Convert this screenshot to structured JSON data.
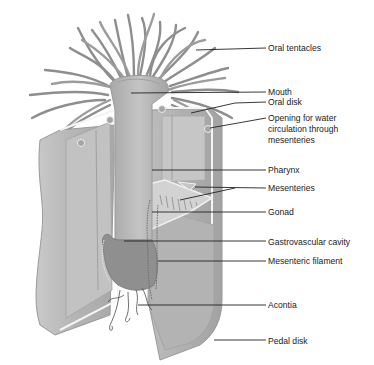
{
  "diagram": {
    "colors": {
      "body": "#b9b9b9",
      "body_dark": "#9a9a9a",
      "body_light": "#d6d6d6",
      "tentacle": "#8e8e8e",
      "gonad": "#8a8a8a",
      "leader_line": "#222222",
      "text": "#1a1a1a"
    },
    "labels": [
      {
        "id": "oral-tentacles",
        "text": "Oral tentacles",
        "x": 268,
        "y": 43,
        "line": [
          [
            196,
            50
          ],
          [
            266,
            48
          ]
        ]
      },
      {
        "id": "mouth",
        "text": "Mouth",
        "x": 268,
        "y": 87,
        "line": [
          [
            131,
            93
          ],
          [
            266,
            92
          ]
        ]
      },
      {
        "id": "oral-disk",
        "text": "Oral disk",
        "x": 268,
        "y": 97,
        "line": [
          [
            191,
            113
          ],
          [
            235,
            103
          ],
          [
            266,
            102
          ]
        ]
      },
      {
        "id": "opening-water",
        "text_lines": [
          "Opening for water",
          "circulation through",
          "mesenteries"
        ],
        "x": 268,
        "y": 113,
        "line": [
          [
            210,
            128
          ],
          [
            266,
            118
          ]
        ]
      },
      {
        "id": "pharynx",
        "text": "Pharynx",
        "x": 268,
        "y": 165,
        "line": [
          [
            152,
            170
          ],
          [
            266,
            170
          ]
        ]
      },
      {
        "id": "mesenteries",
        "text": "Mesenteries",
        "x": 268,
        "y": 183,
        "line": [
          [
            195,
            187
          ],
          [
            266,
            188
          ]
        ],
        "line2": [
          [
            180,
            200
          ],
          [
            235,
            188
          ]
        ]
      },
      {
        "id": "gonad",
        "text": "Gonad",
        "x": 268,
        "y": 207,
        "line": [
          [
            152,
            212
          ],
          [
            266,
            212
          ]
        ]
      },
      {
        "id": "gastrovascular-cavity",
        "text": "Gastrovascular cavity",
        "x": 268,
        "y": 237,
        "line": [
          [
            124,
            241
          ],
          [
            266,
            241
          ]
        ]
      },
      {
        "id": "mesenteric-filament",
        "text": "Mesenteric filament",
        "x": 268,
        "y": 256,
        "line": [
          [
            158,
            261
          ],
          [
            266,
            261
          ]
        ]
      },
      {
        "id": "acontia",
        "text": "Acontia",
        "x": 268,
        "y": 300,
        "line": [
          [
            138,
            305
          ],
          [
            266,
            305
          ]
        ]
      },
      {
        "id": "pedal-disk",
        "text": "Pedal disk",
        "x": 268,
        "y": 336,
        "line": [
          [
            214,
            340
          ],
          [
            266,
            340
          ]
        ]
      }
    ]
  }
}
